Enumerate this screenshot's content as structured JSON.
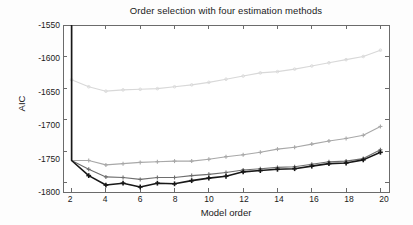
{
  "chart_data": {
    "type": "line",
    "title": "Order selection with four estimation methods",
    "xlabel": "Model order",
    "ylabel": "AIC",
    "xlim": [
      1.5,
      20.5
    ],
    "ylim": [
      -1815,
      -1550
    ],
    "xticks": [
      2,
      4,
      6,
      8,
      10,
      12,
      14,
      16,
      18,
      20
    ],
    "yticks": [
      -1550,
      -1600,
      -1650,
      -1700,
      -1750,
      -1800
    ],
    "xtick_labels": [
      "2",
      "4",
      "6",
      "8",
      "10",
      "12",
      "14",
      "16",
      "18",
      "20"
    ],
    "ytick_labels": [
      "-1550",
      "-1600",
      "-1650",
      "-1700",
      "-1750",
      "-1800"
    ],
    "grid": false,
    "legend": "none",
    "x": [
      2,
      3,
      4,
      5,
      6,
      7,
      8,
      9,
      10,
      11,
      12,
      13,
      14,
      15,
      16,
      17,
      18,
      19,
      20
    ],
    "series": [
      {
        "name": "method-1-light-gray",
        "color": "#d8d8d8",
        "marker": "dot",
        "values": [
          -1637,
          -1648,
          -1655,
          -1653,
          -1652,
          -1651,
          -1648,
          -1645,
          -1641,
          -1636,
          -1631,
          -1626,
          -1624,
          -1620,
          -1615,
          -1610,
          -1605,
          -1600,
          -1590
        ]
      },
      {
        "name": "method-2-medium-gray",
        "color": "#a8a8a8",
        "marker": "plus",
        "values": [
          -1550,
          -1765,
          -1772,
          -1770,
          -1768,
          -1767,
          -1766,
          -1766,
          -1763,
          -1759,
          -1756,
          -1752,
          -1747,
          -1744,
          -1739,
          -1734,
          -1730,
          -1725,
          -1711
        ]
      },
      {
        "name": "method-3-dark-gray",
        "color": "#6e6e6e",
        "marker": "plus",
        "values": [
          -1550,
          -1779,
          -1791,
          -1792,
          -1795,
          -1792,
          -1792,
          -1789,
          -1787,
          -1784,
          -1780,
          -1778,
          -1776,
          -1775,
          -1771,
          -1767,
          -1766,
          -1762,
          -1748
        ]
      },
      {
        "name": "method-4-black",
        "color": "#181818",
        "marker": "plus",
        "values": [
          -1550,
          -1789,
          -1804,
          -1801,
          -1807,
          -1801,
          -1802,
          -1797,
          -1793,
          -1790,
          -1783,
          -1781,
          -1779,
          -1778,
          -1774,
          -1770,
          -1769,
          -1764,
          -1752
        ]
      }
    ],
    "start_spike": {
      "x": 2,
      "note": "Three lower curves rise off the top of the axes at model order 2",
      "value_at_x2": -1765
    }
  }
}
